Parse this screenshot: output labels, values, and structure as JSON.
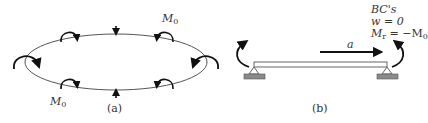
{
  "panel_a": {
    "caption": "(a)",
    "moment_label_top": "M",
    "moment_label_top_sub": "0",
    "moment_label_bottom": "M",
    "moment_label_bottom_sub": "0"
  },
  "panel_b": {
    "caption": "(b)",
    "radius_label": "a",
    "bcs_title": "BC's",
    "bc1": "w = 0",
    "bc2_lhs": "M",
    "bc2_sub": "r",
    "bc2_rhs": " = −M",
    "bc2_rhs_sub": "0"
  },
  "colors": {
    "stroke": "#222222",
    "support": "#8a8a8a",
    "text": "#333333"
  }
}
